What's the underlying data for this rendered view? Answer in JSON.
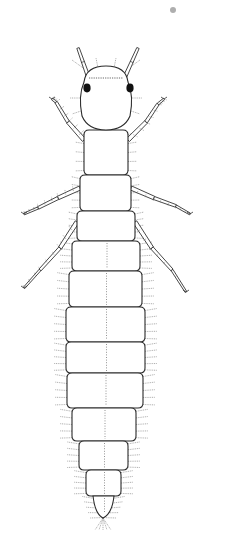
{
  "image": {
    "width": 227,
    "height": 547,
    "background": "#ffffff",
    "subject": "insect larva, dorsal view, line drawing",
    "colors": {
      "outline": "#2a2a2a",
      "setae": "#777777",
      "eye": "#111111",
      "speck": "#9a9a9a"
    }
  },
  "speck": {
    "cx": 173,
    "cy": 10,
    "r": 3
  },
  "head": {
    "cx": 106,
    "top": 66,
    "bottom": 130,
    "halfWidth": 26
  },
  "eyes": [
    {
      "cx": 87,
      "cy": 88
    },
    {
      "cx": 130,
      "cy": 88
    }
  ],
  "antennae": [
    {
      "x1": 89,
      "y1": 79,
      "x2": 78,
      "y2": 48
    },
    {
      "x1": 124,
      "y1": 79,
      "x2": 138,
      "y2": 48
    }
  ],
  "thorax": [
    {
      "top": 130,
      "bottom": 175,
      "left": 84,
      "right": 128
    },
    {
      "top": 175,
      "bottom": 211,
      "left": 80,
      "right": 131
    },
    {
      "top": 211,
      "bottom": 241,
      "left": 77,
      "right": 135
    }
  ],
  "abdomen_segments": [
    {
      "top": 241,
      "bottom": 271,
      "left": 72,
      "right": 140
    },
    {
      "top": 271,
      "bottom": 307,
      "left": 69,
      "right": 142
    },
    {
      "top": 307,
      "bottom": 342,
      "left": 66,
      "right": 145
    },
    {
      "top": 342,
      "bottom": 373,
      "left": 66,
      "right": 145
    },
    {
      "top": 373,
      "bottom": 408,
      "left": 67,
      "right": 143
    },
    {
      "top": 408,
      "bottom": 441,
      "left": 72,
      "right": 136
    },
    {
      "top": 441,
      "bottom": 470,
      "left": 79,
      "right": 128
    },
    {
      "top": 470,
      "bottom": 496,
      "left": 86,
      "right": 121
    },
    {
      "top": 496,
      "bottom": 520,
      "left": 93,
      "right": 114
    }
  ],
  "tip": {
    "x": 103,
    "y": 518
  },
  "legs": [
    {
      "points": [
        [
          84,
          140
        ],
        [
          68,
          122
        ],
        [
          56,
          102
        ],
        [
          52,
          99
        ]
      ],
      "side": "left"
    },
    {
      "points": [
        [
          128,
          140
        ],
        [
          146,
          122
        ],
        [
          158,
          104
        ],
        [
          164,
          99
        ]
      ],
      "side": "right"
    },
    {
      "points": [
        [
          80,
          188
        ],
        [
          58,
          198
        ],
        [
          38,
          208
        ],
        [
          24,
          214
        ]
      ],
      "side": "left"
    },
    {
      "points": [
        [
          131,
          188
        ],
        [
          154,
          198
        ],
        [
          176,
          206
        ],
        [
          190,
          214
        ]
      ],
      "side": "right"
    },
    {
      "points": [
        [
          77,
          222
        ],
        [
          60,
          248
        ],
        [
          40,
          270
        ],
        [
          24,
          288
        ]
      ],
      "side": "left"
    },
    {
      "points": [
        [
          135,
          222
        ],
        [
          152,
          248
        ],
        [
          172,
          270
        ],
        [
          186,
          292
        ]
      ],
      "side": "right"
    }
  ],
  "counts": {
    "thoracic_segments": 3,
    "abdominal_segments": 9,
    "legs": 6,
    "antennae": 2,
    "eyes": 2
  }
}
